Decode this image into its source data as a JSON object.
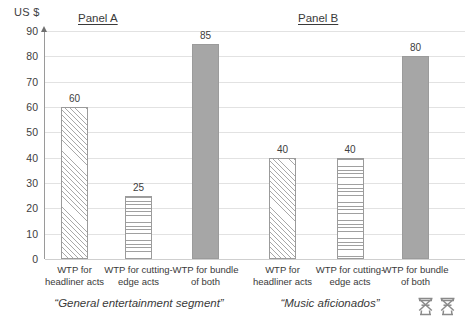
{
  "axis": {
    "unit_label": "US $",
    "ticks": [
      "90",
      "80",
      "70",
      "60",
      "50",
      "40",
      "30",
      "20",
      "10",
      "0"
    ],
    "ymin": 0,
    "ymax": 90,
    "step": 10
  },
  "panels": {
    "a": {
      "title": "Panel A",
      "caption": "“General entertainment segment”",
      "bars": [
        {
          "value": 60,
          "label_line1": "WTP for",
          "label_line2": "headliner acts",
          "pattern": "diag",
          "value_text": "60"
        },
        {
          "value": 25,
          "label_line1": "WTP for cutting-",
          "label_line2": "edge acts",
          "pattern": "horiz",
          "value_text": "25"
        },
        {
          "value": 85,
          "label_line1": "WTP for bundle",
          "label_line2": "of both",
          "pattern": "solid",
          "value_text": "85"
        }
      ]
    },
    "b": {
      "title": "Panel B",
      "caption": "“Music aficionados”",
      "bars": [
        {
          "value": 40,
          "label_line1": "WTP for",
          "label_line2": "headliner acts",
          "pattern": "diag",
          "value_text": "40"
        },
        {
          "value": 40,
          "label_line1": "WTP for cutting-",
          "label_line2": "edge acts",
          "pattern": "horiz",
          "value_text": "40"
        },
        {
          "value": 80,
          "label_line1": "WTP for bundle",
          "label_line2": "of both",
          "pattern": "solid",
          "value_text": "80"
        }
      ]
    }
  },
  "icons": {
    "director_chair_1": "director-chair-icon",
    "director_chair_2": "director-chair-icon"
  },
  "colors": {
    "solid_bar_fill": "#a6a6a6",
    "bar_border": "#9b9b9b",
    "gridline": "#e2e2e2",
    "text": "#3a3a3a"
  },
  "chart_data": {
    "type": "bar",
    "title": "",
    "xlabel": "",
    "ylabel": "US $",
    "ylim": [
      0,
      90
    ],
    "ytick_step": 10,
    "grid": true,
    "legend": "none",
    "panels": [
      {
        "name": "Panel A",
        "subtitle": "“General entertainment segment”",
        "categories": [
          "WTP for headliner acts",
          "WTP for cutting-edge acts",
          "WTP for bundle of both"
        ],
        "values": [
          60,
          25,
          85
        ],
        "fills": [
          "diagonal-hatch",
          "horizontal-hatch",
          "solid-gray"
        ]
      },
      {
        "name": "Panel B",
        "subtitle": "“Music aficionados”",
        "categories": [
          "WTP for headliner acts",
          "WTP for cutting-edge acts",
          "WTP for bundle of both"
        ],
        "values": [
          40,
          40,
          80
        ],
        "fills": [
          "diagonal-hatch",
          "horizontal-hatch",
          "solid-gray"
        ]
      }
    ]
  }
}
